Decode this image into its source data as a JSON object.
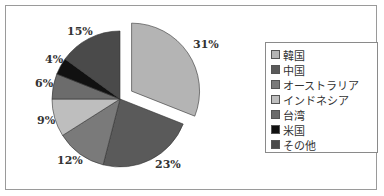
{
  "chart_data": {
    "type": "pie",
    "title": "",
    "categories": [
      "韓国",
      "中国",
      "オーストラリア",
      "インドネシア",
      "台湾",
      "米国",
      "その他"
    ],
    "values": [
      31,
      23,
      12,
      9,
      6,
      4,
      15
    ],
    "value_labels": [
      "31%",
      "23%",
      "12%",
      "9%",
      "6%",
      "4%",
      "15%"
    ],
    "colors": [
      "#b4b4b4",
      "#5a5a5a",
      "#7a7a7a",
      "#bebebe",
      "#6c6c6c",
      "#111111",
      "#4a4a4a"
    ],
    "exploded": [
      "韓国"
    ],
    "start_angle": "12 o'clock, clockwise",
    "legend_position": "right"
  },
  "legend": {
    "items": [
      {
        "label": "韓国",
        "color": "#b4b4b4"
      },
      {
        "label": "中国",
        "color": "#5a5a5a"
      },
      {
        "label": "オーストラリア",
        "color": "#7a7a7a"
      },
      {
        "label": "インドネシア",
        "color": "#bebebe"
      },
      {
        "label": "台湾",
        "color": "#6c6c6c"
      },
      {
        "label": "米国",
        "color": "#111111"
      },
      {
        "label": "その他",
        "color": "#4a4a4a"
      }
    ]
  },
  "labels": {
    "korea": "31%",
    "china": "23%",
    "australia": "12%",
    "indonesia": "9%",
    "taiwan": "6%",
    "usa": "4%",
    "other": "15%"
  }
}
